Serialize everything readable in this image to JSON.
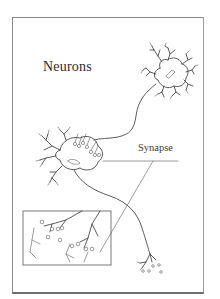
{
  "figure": {
    "title": "Neurons",
    "labels": {
      "synapse": "Synapse"
    },
    "colors": {
      "background": "#ffffff",
      "frame": "#8a8a8a",
      "ink": "#4a4a4a",
      "text": "#2a2a2a"
    },
    "elements": [
      "upper-right neuron cell body with dendrites",
      "axon from upper neuron to middle neuron",
      "middle neuron cell body with dendrites and synaptic terminals",
      "axon from middle neuron down to lower-right terminal branches",
      "inset box with magnified synapse detail",
      "synapse label leader lines"
    ]
  }
}
